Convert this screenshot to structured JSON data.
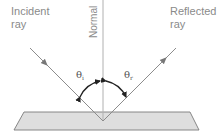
{
  "labels": {
    "incident": [
      "Incident",
      "ray"
    ],
    "reflected": [
      "Reflected",
      "ray"
    ],
    "normal": "Normal",
    "theta_i": "θ",
    "theta_i_sub": "i",
    "theta_r": "θ",
    "theta_r_sub": "r"
  },
  "colors": {
    "ray": "#8c8c8c",
    "normal": "#b0b0b0",
    "arc": "#222222",
    "surface_fill": "#dcdcdc",
    "surface_stroke": "#777777",
    "text": "#8a8a8a"
  }
}
